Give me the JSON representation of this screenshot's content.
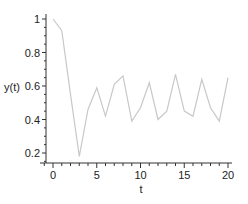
{
  "chart_data": {
    "type": "line",
    "title": "",
    "xlabel": "t",
    "ylabel": "y(t)",
    "xlim": [
      -1,
      21
    ],
    "ylim": [
      0.14,
      1.02
    ],
    "x_ticks": [
      0,
      5,
      10,
      15,
      20
    ],
    "x_tick_labels": [
      "0",
      "5",
      "10",
      "15",
      "20"
    ],
    "y_ticks": [
      0.2,
      0.4,
      0.6,
      0.8,
      1
    ],
    "y_tick_labels": [
      "0.2",
      "0.4",
      "0.6",
      "0.8",
      "1"
    ],
    "grid": false,
    "legend": null,
    "series": [
      {
        "name": "y(t)",
        "color": "#c8c8c8",
        "x": [
          0,
          1,
          2,
          3,
          4,
          5,
          6,
          7,
          8,
          9,
          10,
          11,
          12,
          13,
          14,
          15,
          16,
          17,
          18,
          19,
          20
        ],
        "values": [
          1.0,
          0.93,
          0.55,
          0.18,
          0.46,
          0.59,
          0.42,
          0.61,
          0.66,
          0.39,
          0.47,
          0.62,
          0.4,
          0.45,
          0.67,
          0.45,
          0.42,
          0.64,
          0.47,
          0.39,
          0.65
        ]
      }
    ]
  }
}
